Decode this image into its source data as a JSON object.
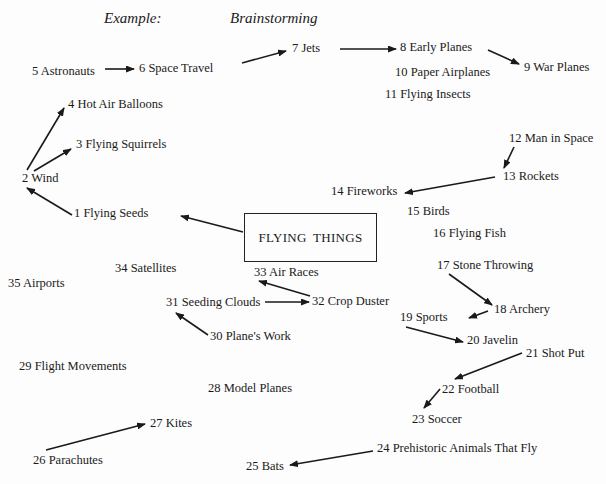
{
  "headings": {
    "example": "Example:",
    "brainstorming": "Brainstorming"
  },
  "center_topic": "FLYING THINGS",
  "nodes": [
    {
      "id": 1,
      "label": "1 Flying Seeds",
      "x": 74,
      "y": 206
    },
    {
      "id": 2,
      "label": "2 Wind",
      "x": 22,
      "y": 171
    },
    {
      "id": 3,
      "label": "3 Flying Squirrels",
      "x": 76,
      "y": 137
    },
    {
      "id": 4,
      "label": "4 Hot Air Balloons",
      "x": 68,
      "y": 97
    },
    {
      "id": 5,
      "label": "5 Astronauts",
      "x": 32,
      "y": 64
    },
    {
      "id": 6,
      "label": "6 Space Travel",
      "x": 139,
      "y": 61
    },
    {
      "id": 7,
      "label": "7 Jets",
      "x": 292,
      "y": 41
    },
    {
      "id": 8,
      "label": "8 Early Planes",
      "x": 400,
      "y": 40
    },
    {
      "id": 9,
      "label": "9 War Planes",
      "x": 524,
      "y": 60
    },
    {
      "id": 10,
      "label": "10 Paper Airplanes",
      "x": 395,
      "y": 65
    },
    {
      "id": 11,
      "label": "11 Flying Insects",
      "x": 385,
      "y": 87
    },
    {
      "id": 12,
      "label": "12 Man in Space",
      "x": 509,
      "y": 131
    },
    {
      "id": 13,
      "label": "13 Rockets",
      "x": 503,
      "y": 169
    },
    {
      "id": 14,
      "label": "14 Fireworks",
      "x": 331,
      "y": 184
    },
    {
      "id": 15,
      "label": "15 Birds",
      "x": 407,
      "y": 204
    },
    {
      "id": 16,
      "label": "16 Flying Fish",
      "x": 433,
      "y": 226
    },
    {
      "id": 17,
      "label": "17 Stone Throwing",
      "x": 437,
      "y": 258
    },
    {
      "id": 18,
      "label": "18 Archery",
      "x": 494,
      "y": 302
    },
    {
      "id": 19,
      "label": "19 Sports",
      "x": 400,
      "y": 310
    },
    {
      "id": 20,
      "label": "20 Javelin",
      "x": 467,
      "y": 333
    },
    {
      "id": 21,
      "label": "21 Shot Put",
      "x": 526,
      "y": 346
    },
    {
      "id": 22,
      "label": "22 Football",
      "x": 442,
      "y": 382
    },
    {
      "id": 23,
      "label": "23 Soccer",
      "x": 412,
      "y": 412
    },
    {
      "id": 24,
      "label": "24 Prehistoric Animals That Fly",
      "x": 377,
      "y": 441
    },
    {
      "id": 25,
      "label": "25 Bats",
      "x": 246,
      "y": 459
    },
    {
      "id": 26,
      "label": "26 Parachutes",
      "x": 33,
      "y": 453
    },
    {
      "id": 27,
      "label": "27 Kites",
      "x": 150,
      "y": 416
    },
    {
      "id": 28,
      "label": "28 Model Planes",
      "x": 208,
      "y": 381
    },
    {
      "id": 29,
      "label": "29 Flight Movements",
      "x": 19,
      "y": 359
    },
    {
      "id": 30,
      "label": "30 Plane's Work",
      "x": 210,
      "y": 329
    },
    {
      "id": 31,
      "label": "31 Seeding Clouds",
      "x": 166,
      "y": 295
    },
    {
      "id": 32,
      "label": "32 Crop Duster",
      "x": 312,
      "y": 294
    },
    {
      "id": 33,
      "label": "33 Air Races",
      "x": 254,
      "y": 265
    },
    {
      "id": 34,
      "label": "34 Satellites",
      "x": 115,
      "y": 261
    },
    {
      "id": 35,
      "label": "35 Airports",
      "x": 8,
      "y": 276
    }
  ],
  "arrows": [
    {
      "from": "5 Astronauts",
      "to": "6 Space Travel",
      "x1": 105,
      "y1": 69,
      "x2": 134,
      "y2": 69
    },
    {
      "from": "6 Space Travel",
      "to": "7 Jets",
      "x1": 242,
      "y1": 63,
      "x2": 286,
      "y2": 51
    },
    {
      "from": "7 Jets",
      "to": "8 Early Planes",
      "x1": 340,
      "y1": 49,
      "x2": 396,
      "y2": 49
    },
    {
      "from": "8 Early Planes",
      "to": "9 War Planes",
      "x1": 488,
      "y1": 50,
      "x2": 519,
      "y2": 64
    },
    {
      "from": "2 Wind",
      "to": "4 Hot Air Balloons",
      "x1": 27,
      "y1": 170,
      "x2": 64,
      "y2": 108
    },
    {
      "from": "2 Wind",
      "to": "3 Flying Squirrels",
      "x1": 34,
      "y1": 171,
      "x2": 71,
      "y2": 149
    },
    {
      "from": "1 Flying Seeds",
      "to": "2 Wind",
      "x1": 72,
      "y1": 215,
      "x2": 27,
      "y2": 188
    },
    {
      "from": "FLYING THINGS",
      "to": "1 Flying Seeds",
      "x1": 243,
      "y1": 232,
      "x2": 181,
      "y2": 216
    },
    {
      "from": "12 Man in Space",
      "to": "13 Rockets",
      "x1": 514,
      "y1": 147,
      "x2": 504,
      "y2": 168
    },
    {
      "from": "13 Rockets",
      "to": "14 Fireworks",
      "x1": 495,
      "y1": 177,
      "x2": 405,
      "y2": 193
    },
    {
      "from": "32 Crop Duster",
      "to": "33 Air Races",
      "x1": 310,
      "y1": 296,
      "x2": 259,
      "y2": 281
    },
    {
      "from": "31 Seeding Clouds",
      "to": "32 Crop Duster",
      "x1": 265,
      "y1": 302,
      "x2": 309,
      "y2": 302
    },
    {
      "from": "30 Plane's Work",
      "to": "31 Seeding Clouds",
      "x1": 208,
      "y1": 335,
      "x2": 176,
      "y2": 313
    },
    {
      "from": "17 Stone Throwing",
      "to": "18 Archery",
      "x1": 449,
      "y1": 274,
      "x2": 492,
      "y2": 305
    },
    {
      "from": "18 Archery",
      "to": "19 Sports",
      "x1": 488,
      "y1": 311,
      "x2": 469,
      "y2": 318
    },
    {
      "from": "19 Sports",
      "to": "20 Javelin",
      "x1": 406,
      "y1": 327,
      "x2": 463,
      "y2": 342
    },
    {
      "from": "21 Shot Put",
      "to": "22 Football",
      "x1": 522,
      "y1": 353,
      "x2": 455,
      "y2": 379
    },
    {
      "from": "22 Football",
      "to": "23 Soccer",
      "x1": 440,
      "y1": 389,
      "x2": 424,
      "y2": 408
    },
    {
      "from": "24 Prehistoric Animals That Fly",
      "to": "25 Bats",
      "x1": 373,
      "y1": 451,
      "x2": 290,
      "y2": 465
    },
    {
      "from": "26 Parachutes",
      "to": "27 Kites",
      "x1": 46,
      "y1": 450,
      "x2": 145,
      "y2": 424
    }
  ],
  "colors": {
    "ink": "#1a1a1a",
    "paper": "#fdfdfd"
  }
}
